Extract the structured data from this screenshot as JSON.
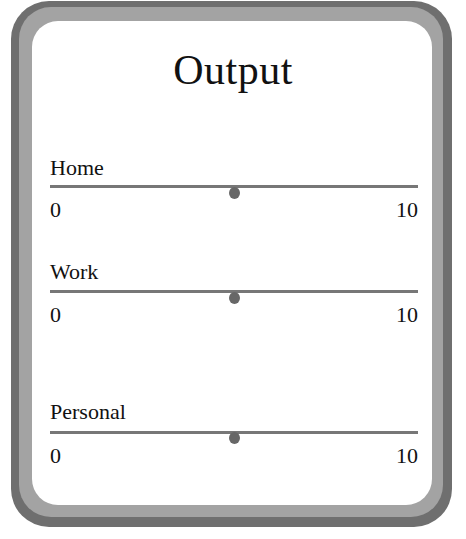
{
  "title": "Output",
  "colors": {
    "frame_outer": "#6f6f6f",
    "frame_inner": "#a3a3a3",
    "panel": "#ffffff",
    "track": "#777777",
    "thumb": "#676767",
    "text": "#111111"
  },
  "sliders": [
    {
      "label": "Home",
      "min": "0",
      "max": "10",
      "value": 5
    },
    {
      "label": "Work",
      "min": "0",
      "max": "10",
      "value": 5
    },
    {
      "label": "Personal",
      "min": "0",
      "max": "10",
      "value": 5
    }
  ]
}
